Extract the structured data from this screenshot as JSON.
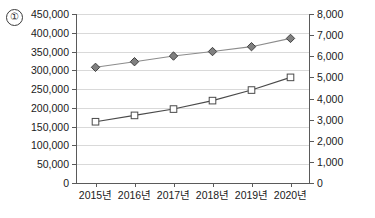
{
  "annotation": {
    "index_label": "①"
  },
  "chart_data": {
    "type": "line",
    "title": "",
    "xlabel": "",
    "ylabel": "",
    "grid": true,
    "legend": "none",
    "categories": [
      "2015년",
      "2016년",
      "2017년",
      "2018년",
      "2019년",
      "2020년"
    ],
    "axes": {
      "left": {
        "ylim": [
          0,
          450000
        ],
        "tick_step": 50000,
        "tick_labels": [
          "0",
          "50,000",
          "100,000",
          "150,000",
          "200,000",
          "250,000",
          "300,000",
          "350,000",
          "400,000",
          "450,000"
        ],
        "tick_values": [
          0,
          50000,
          100000,
          150000,
          200000,
          250000,
          300000,
          350000,
          400000,
          450000
        ]
      },
      "right": {
        "ylim": [
          0,
          8000
        ],
        "tick_step": 1000,
        "tick_labels": [
          "0",
          "1,000",
          "2,000",
          "3,000",
          "4,000",
          "5,000",
          "6,000",
          "7,000",
          "8,000"
        ],
        "tick_values": [
          0,
          1000,
          2000,
          3000,
          4000,
          5000,
          6000,
          7000,
          8000
        ]
      }
    },
    "series": [
      {
        "name": "diamond-series",
        "axis": "left",
        "marker": "diamond",
        "marker_fill": "#808080",
        "marker_stroke": "#404040",
        "line_color": "#8c8c8c",
        "values": [
          308000,
          323000,
          338000,
          350000,
          363000,
          385000
        ]
      },
      {
        "name": "square-series",
        "axis": "right",
        "marker": "square",
        "marker_fill": "#ffffff",
        "marker_stroke": "#4a4a4a",
        "line_color": "#4a4a4a",
        "values": [
          2900,
          3200,
          3500,
          3900,
          4400,
          5000
        ]
      }
    ]
  },
  "colors": {
    "grid": "#d9d9d9",
    "axis": "#5a5a5a",
    "text": "#1a1a1a"
  }
}
